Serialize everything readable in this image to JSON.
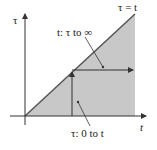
{
  "diagram": {
    "axis_y_label": "τ",
    "axis_x_label": "t",
    "diagonal_label": "τ = t",
    "upper_annotation": "t: τ to ∞",
    "lower_annotation": "τ: 0 to t",
    "colors": {
      "fill": "#c8c8c8",
      "line": "#555555",
      "axis": "#333333"
    }
  }
}
